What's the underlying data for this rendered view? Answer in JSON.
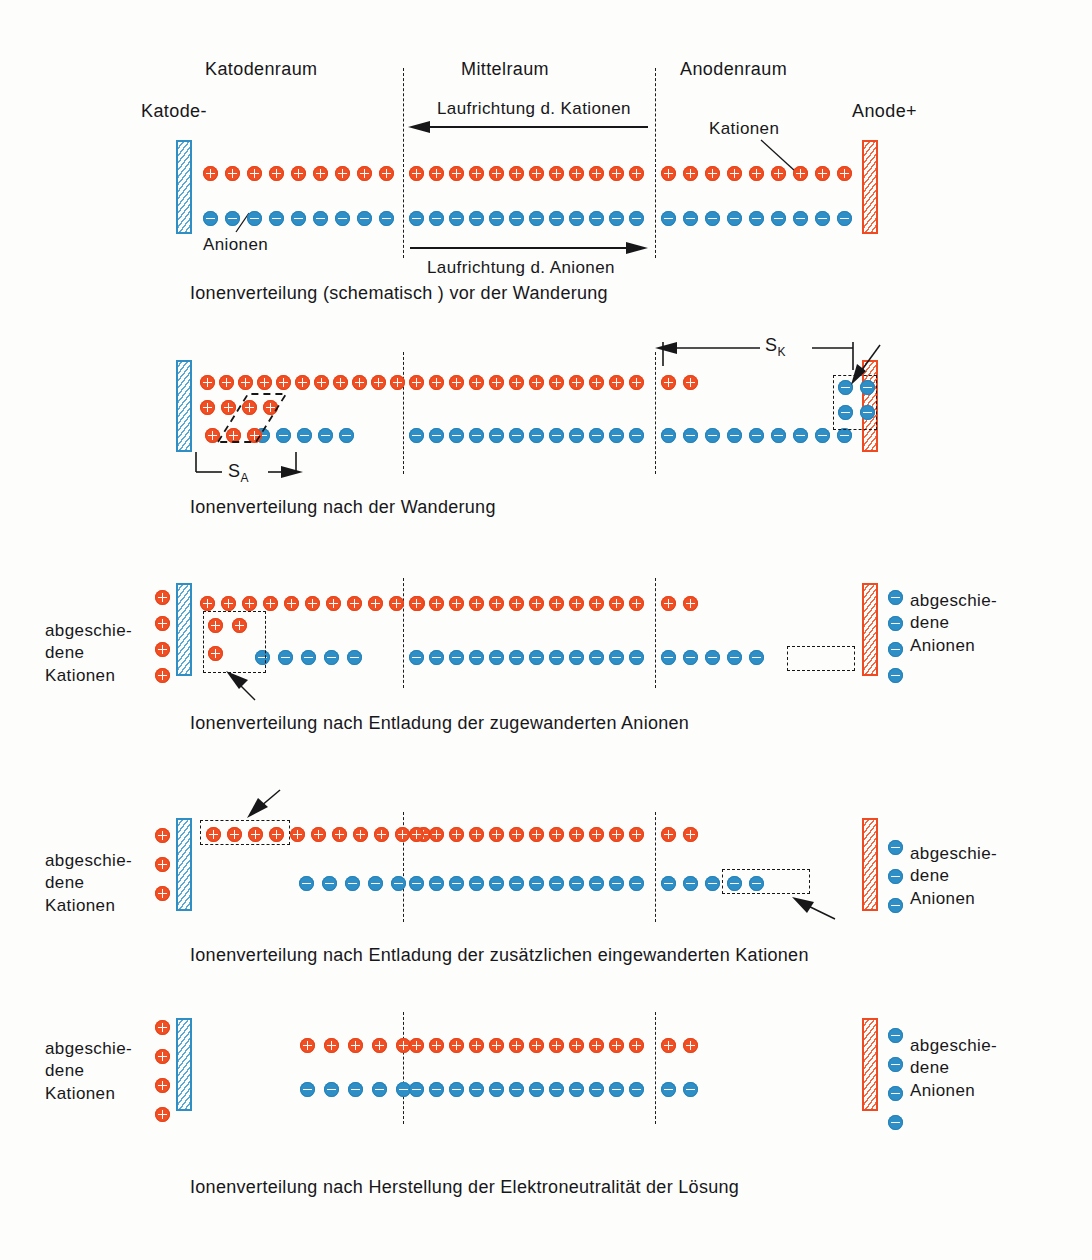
{
  "figure": {
    "language": "de"
  },
  "colors": {
    "cation": "#f04e23",
    "anion": "#2e8fc6",
    "cathode_border": "#2f8fc4",
    "anode_border": "#ef4a22",
    "text": "#17171a"
  },
  "header": {
    "compartments": {
      "cathode_space": "Katodenraum",
      "middle_space": "Mittelraum",
      "anode_space": "Anodenraum"
    },
    "electrodes": {
      "cathode": "Katode-",
      "anode": "Anode+"
    },
    "flow_cations": "Laufrichtung d. Kationen",
    "flow_anions": "Laufrichtung d. Anionen",
    "callout_cations": "Kationen",
    "callout_anions": "Anionen"
  },
  "measure": {
    "s_k_base": "S",
    "s_k_sub": "K",
    "s_a_base": "S",
    "s_a_sub": "A"
  },
  "side_labels": {
    "deposited_cations": [
      "abgeschie-",
      "dene",
      "Kationen"
    ],
    "deposited_anions": [
      "abgeschie-",
      "dene",
      "Anionen"
    ]
  },
  "stages": [
    {
      "id": "stage-1",
      "caption": "Ionenverteilung (schematisch ) vor der Wanderung",
      "cations": {
        "cathode": 9,
        "middle": 12,
        "anode": 9
      },
      "anions": {
        "cathode": 9,
        "middle": 12,
        "anode": 9
      }
    },
    {
      "id": "stage-2",
      "caption": "Ionenverteilung nach der Wanderung",
      "cations": {
        "cathode": 11,
        "middle": 12,
        "anode": 2
      },
      "anions": {
        "cathode": 5,
        "middle": 12,
        "anode": 9
      },
      "extra_cation_rows": 2,
      "extra_anion_block": 4,
      "note_s_k": "Wanderungsstrecke der Kationen",
      "note_s_a": "Wanderungsstrecke der Anionen"
    },
    {
      "id": "stage-3",
      "caption": "Ionenverteilung nach Entladung der zugewanderten Anionen",
      "cations": {
        "cathode": 11,
        "middle": 12,
        "anode": 2
      },
      "anions": {
        "cathode": 5,
        "middle": 12,
        "anode": 5
      },
      "deposited_cations": 4,
      "deposited_anions": 4,
      "highlight_cations": 3
    },
    {
      "id": "stage-4",
      "caption": "Ionenverteilung nach Entladung der zusätzlichen eingewanderten Kationen",
      "cations": {
        "cathode": 11,
        "middle": 12,
        "anode": 2
      },
      "anions": {
        "cathode": 5,
        "middle": 12,
        "anode": 5
      },
      "deposited_cations": 3,
      "deposited_anions": 3,
      "highlight_cations": 4,
      "highlight_anions": 4
    },
    {
      "id": "stage-5",
      "caption": "Ionenverteilung nach Herstellung der Elektroneutralität der Lösung",
      "cations": {
        "cathode": 5,
        "middle": 12,
        "anode": 2
      },
      "anions": {
        "cathode": 5,
        "middle": 12,
        "anode": 2
      },
      "deposited_cations": 4,
      "deposited_anions": 4
    }
  ]
}
